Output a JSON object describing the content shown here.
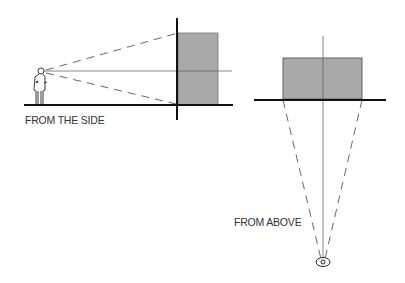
{
  "diagram": {
    "side_view": {
      "label": "FROM THE SIDE",
      "observer": "standing-person",
      "object": "gray-rectangle",
      "colors": {
        "object_fill": "#a9a9a9",
        "lines": "#222222"
      }
    },
    "top_view": {
      "label": "FROM ABOVE",
      "observer": "eye",
      "object": "gray-rectangle",
      "colors": {
        "object_fill": "#a9a9a9",
        "lines": "#222222"
      }
    }
  }
}
